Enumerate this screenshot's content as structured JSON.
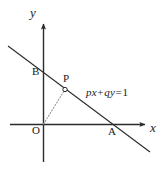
{
  "figure": {
    "type": "coordinate-geometry-diagram",
    "background_color": "#ffffff",
    "stroke_color": "#2b2b2b",
    "dotted_color": "#9a9a9a",
    "axes": {
      "x_label": "x",
      "y_label": "y",
      "origin_label": "O",
      "x_axis": {
        "start": [
          10,
          124
        ],
        "end": [
          150,
          124
        ],
        "arrow": true
      },
      "y_axis": {
        "start": [
          43,
          162
        ],
        "end": [
          43,
          18
        ],
        "arrow": true
      }
    },
    "points": [
      {
        "name": "O",
        "label": "O",
        "x": 43,
        "y": 124,
        "label_x": 32,
        "label_y": 126,
        "marker": false
      },
      {
        "name": "B",
        "label": "B",
        "x": 43,
        "y": 66,
        "label_x": 32,
        "label_y": 67,
        "marker": false
      },
      {
        "name": "P",
        "label": "P",
        "x": 65,
        "y": 89,
        "label_x": 63,
        "label_y": 74,
        "marker": true
      },
      {
        "name": "A",
        "label": "A",
        "x": 112,
        "y": 124,
        "label_x": 108,
        "label_y": 127,
        "marker": false
      }
    ],
    "lines": [
      {
        "name": "main-line",
        "label": "px+qy=1",
        "label_x": 86,
        "label_y": 87,
        "start": [
          8,
          46
        ],
        "end": [
          150,
          152
        ],
        "style": "solid"
      },
      {
        "name": "op-segment",
        "start": [
          43,
          124
        ],
        "end": [
          65,
          89
        ],
        "style": "dotted"
      }
    ],
    "equation": {
      "full": "px+qy=1",
      "term1_coeff": "p",
      "term1_var": "x",
      "operator": "+",
      "term2_coeff": "q",
      "term2_var": "y",
      "equals": "=",
      "rhs": "1"
    }
  }
}
